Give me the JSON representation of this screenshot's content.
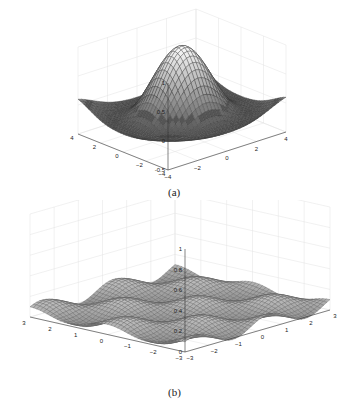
{
  "figure": {
    "panels": [
      {
        "id": "a",
        "caption": "(a)"
      },
      {
        "id": "b",
        "caption": "(b)"
      }
    ]
  },
  "chart_data": [
    {
      "type": "surface3d",
      "title": "",
      "caption": "(a)",
      "function": "sinc-like radial surface (peak 1 at origin, ripples around)",
      "xlim": [
        -4,
        4
      ],
      "ylim": [
        -4,
        4
      ],
      "zlim": [
        -0.5,
        1
      ],
      "x_ticks": [
        -4,
        -2,
        0,
        2,
        4
      ],
      "y_ticks": [
        -4,
        -2,
        0,
        2,
        4
      ],
      "z_ticks": [
        -0.5,
        0,
        0.5,
        1
      ],
      "z_tick_labels": [
        "-0.5",
        "0",
        "0.5",
        "1"
      ],
      "peak": {
        "x": 0,
        "y": 0,
        "z": 1
      },
      "grid": true,
      "colormap": "gray"
    },
    {
      "type": "surface3d",
      "title": "",
      "caption": "(b)",
      "function": "low-amplitude periodic wavy surface",
      "xlim": [
        -3,
        3
      ],
      "ylim": [
        -3,
        3
      ],
      "zlim": [
        0,
        1
      ],
      "x_ticks": [
        -3,
        -2,
        -1,
        0,
        1,
        2,
        3
      ],
      "y_ticks": [
        -3,
        -2,
        -1,
        0,
        1,
        2,
        3
      ],
      "z_ticks": [
        0,
        0.2,
        0.4,
        0.6,
        0.8,
        1
      ],
      "z_tick_labels": [
        "0",
        "0.2",
        "0.4",
        "0.6",
        "0.8",
        "1"
      ],
      "approx_max_z": 0.2,
      "grid": true,
      "colormap": "gray"
    }
  ]
}
